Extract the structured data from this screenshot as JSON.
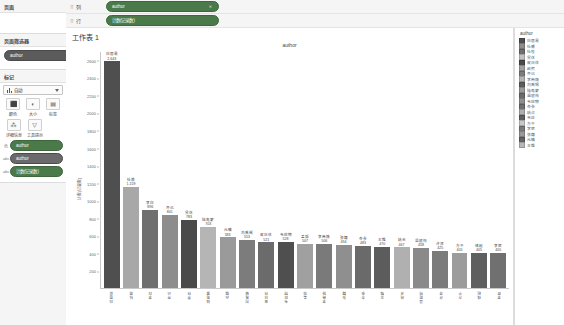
{
  "sidebar": {
    "data_panel": {
      "title": "页面"
    },
    "page_filter": {
      "title": "页面筛选器",
      "pill": "author"
    },
    "marks": {
      "title": "标记",
      "type_select": "自动",
      "type_icon": "bar-mark-icon",
      "buttons": [
        {
          "label": "颜色",
          "icon": "color-icon",
          "glyph": "⬛"
        },
        {
          "label": "大小",
          "icon": "size-icon",
          "glyph": "◐"
        },
        {
          "label": "标签",
          "icon": "label-icon",
          "glyph": "▤"
        },
        {
          "label": "详细信息",
          "icon": "detail-icon",
          "glyph": "⁂"
        },
        {
          "label": "工具提示",
          "icon": "tooltip-icon",
          "glyph": "▽"
        }
      ],
      "pills": [
        {
          "prefix": "色",
          "label": "author",
          "color": "green"
        },
        {
          "prefix": "abc",
          "label": "author",
          "color": "dark"
        },
        {
          "prefix": "abc",
          "label": "计数(记录数)",
          "color": "green"
        }
      ]
    }
  },
  "shelves": [
    {
      "name": "列",
      "pill": "author",
      "color": "green",
      "has_close": true
    },
    {
      "name": "行",
      "pill": "计数(记录数)",
      "color": "green",
      "has_close": false
    }
  ],
  "worksheet": {
    "title": "工作表 1"
  },
  "chart_data": {
    "type": "bar",
    "title": "author",
    "xlabel": "author",
    "ylabel": "计数(记录数)",
    "ylim": [
      0,
      2700
    ],
    "yticks": [
      2600,
      2400,
      2200,
      2000,
      1800,
      1600,
      1400,
      1200,
      1000,
      800,
      600,
      400,
      200
    ],
    "grid": false,
    "legend_position": "right",
    "categories": [
      "白居易",
      "杜甫",
      "李白",
      "齐己",
      "贯休",
      "陆龟蒙",
      "元稹",
      "刘禹锡",
      "皮日休",
      "韦应物",
      "孟郊",
      "李商隐",
      "张籍",
      "岑参",
      "王维",
      "姚合",
      "温庭筠",
      "许浑",
      "方干",
      "钱起",
      "李贺"
    ],
    "values": [
      2643,
      1159,
      896,
      841,
      783,
      703,
      583,
      553,
      521,
      528,
      507,
      506,
      494,
      483,
      470,
      467,
      458,
      425,
      405,
      405,
      405
    ],
    "labels": [
      "2,643",
      "1,159",
      "896",
      "841",
      "783",
      "703",
      "583",
      "553",
      "521",
      "528",
      "507",
      "506",
      "494",
      "483",
      "470",
      "467",
      "458",
      "425",
      "405",
      "405",
      "405"
    ],
    "bar_colors": [
      "#4f4f4f",
      "#a8a8a8",
      "#6f6f6f",
      "#8d8d8d",
      "#4a4a4a",
      "#b5b5b5",
      "#9a9a9a",
      "#7c7c7c",
      "#6b6b6b",
      "#4f4f4f",
      "#a0a0a0",
      "#7a7a7a",
      "#8f8f8f",
      "#6a6a6a",
      "#5c5c5c",
      "#b0b0b0",
      "#8a8a8a",
      "#7b7b7b",
      "#9c9c9c",
      "#5f5f5f",
      "#707070"
    ]
  },
  "legend": {
    "title": "author",
    "items": [
      {
        "label": "白居易",
        "color": "#4f4f4f"
      },
      {
        "label": "杜甫",
        "color": "#8d8d8d"
      },
      {
        "label": "杜牧",
        "color": "#6f6f6f"
      },
      {
        "label": "贯休",
        "color": "#c2c2c2"
      },
      {
        "label": "皮日休",
        "color": "#4a4a4a"
      },
      {
        "label": "赵熙",
        "color": "#a0a0a0"
      },
      {
        "label": "齐己",
        "color": "#7c7c7c"
      },
      {
        "label": "李商隐",
        "color": "#b5b5b5"
      },
      {
        "label": "刘禹锡",
        "color": "#5c5c5c"
      },
      {
        "label": "陆龟蒙",
        "color": "#9a9a9a"
      },
      {
        "label": "温庭筠",
        "color": "#6b6b6b"
      },
      {
        "label": "韦应物",
        "color": "#8f8f8f"
      },
      {
        "label": "岑参",
        "color": "#707070"
      },
      {
        "label": "姚合",
        "color": "#aeaeae"
      },
      {
        "label": "韦庄",
        "color": "#5f5f5f"
      },
      {
        "label": "方干",
        "color": "#c8c8c8"
      },
      {
        "label": "李贺",
        "color": "#7a7a7a"
      },
      {
        "label": "张籍",
        "color": "#999999"
      },
      {
        "label": "元稹",
        "color": "#636363"
      },
      {
        "label": "王维",
        "color": "#b8b8b8"
      }
    ]
  }
}
